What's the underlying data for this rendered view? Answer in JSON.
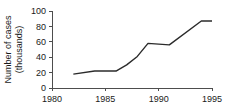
{
  "chart_data": {
    "type": "line",
    "title": "",
    "xlabel": "",
    "ylabel": "Number of cases (thousands)",
    "ylabel_line1": "Number of cases",
    "ylabel_line2": "(thousands)",
    "xlim": [
      1980,
      1995
    ],
    "ylim": [
      0,
      100
    ],
    "grid": false,
    "legend": "none",
    "xticks": [
      1980,
      1985,
      1990,
      1995
    ],
    "xtick_labels": [
      "1980",
      "1985",
      "1990",
      "1995"
    ],
    "yticks": [
      0,
      20,
      40,
      60,
      80,
      100
    ],
    "ytick_labels": [
      "0",
      "20",
      "40",
      "60",
      "80",
      "100"
    ],
    "line_color": "#2b2b2b",
    "axis_color": "#4d4d4d",
    "background_color": "#ffffff",
    "x": [
      1982,
      1984,
      1986,
      1987,
      1988,
      1989,
      1991,
      1994,
      1995
    ],
    "values": [
      18,
      22,
      22,
      30,
      41,
      58,
      56,
      87,
      87
    ],
    "series": [
      {
        "name": "Number of cases",
        "x": [
          1982,
          1984,
          1986,
          1987,
          1988,
          1989,
          1991,
          1994,
          1995
        ],
        "values": [
          18,
          22,
          22,
          30,
          41,
          58,
          56,
          87,
          87
        ]
      }
    ]
  }
}
